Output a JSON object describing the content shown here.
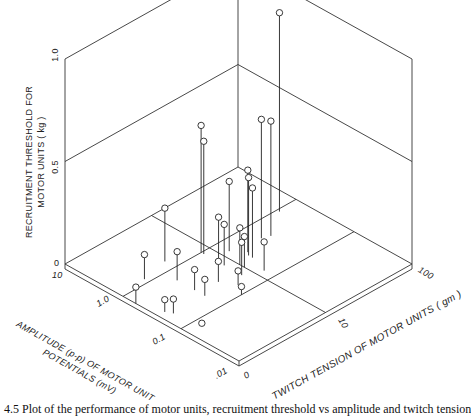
{
  "chart_data": {
    "type": "scatter",
    "subtype": "3d-stem",
    "title": "",
    "zlabel": "RECRUITMENT THRESHOLD FOR MOTOR UNITS ( kg )",
    "xlabel": "AMPLITUDE (p-p) OF MOTOR UNIT POTENTIALS (mV)",
    "ylabel": "TWITCH TENSION OF MOTOR UNITS ( gm )",
    "z_ticks": [
      "0",
      "0.5",
      "1.0"
    ],
    "zlim": [
      0,
      1.0
    ],
    "x_ticks": [
      "10",
      "1.0",
      "0.1",
      ".01"
    ],
    "x_scale": "log",
    "y_ticks": [
      "0",
      "10",
      "100"
    ],
    "y_scale": "log",
    "grid": true,
    "points": [
      {
        "amp": 0.9,
        "tension": 60,
        "threshold": 0.97
      },
      {
        "amp": 1.0,
        "tension": 8,
        "threshold": 0.62
      },
      {
        "amp": 0.9,
        "tension": 8,
        "threshold": 0.55
      },
      {
        "amp": 0.5,
        "tension": 25,
        "threshold": 0.58
      },
      {
        "amp": 0.45,
        "tension": 30,
        "threshold": 0.56
      },
      {
        "amp": 0.6,
        "tension": 12,
        "threshold": 0.34
      },
      {
        "amp": 0.4,
        "tension": 15,
        "threshold": 0.4
      },
      {
        "amp": 0.35,
        "tension": 14,
        "threshold": 0.38
      },
      {
        "amp": 0.3,
        "tension": 14,
        "threshold": 0.34
      },
      {
        "amp": 1.5,
        "tension": 4,
        "threshold": 0.26
      },
      {
        "amp": 0.5,
        "tension": 8,
        "threshold": 0.22
      },
      {
        "amp": 0.4,
        "tension": 8,
        "threshold": 0.2
      },
      {
        "amp": 0.3,
        "tension": 10,
        "threshold": 0.18
      },
      {
        "amp": 0.25,
        "tension": 10,
        "threshold": 0.15
      },
      {
        "amp": 1.2,
        "tension": 2,
        "threshold": 0.12
      },
      {
        "amp": 0.6,
        "tension": 3,
        "threshold": 0.14
      },
      {
        "amp": 0.25,
        "tension": 5,
        "threshold": 0.1
      },
      {
        "amp": 0.2,
        "tension": 8,
        "threshold": 0.16
      },
      {
        "amp": 0.15,
        "tension": 12,
        "threshold": 0.14
      },
      {
        "amp": 0.3,
        "tension": 3,
        "threshold": 0.1
      },
      {
        "amp": 0.2,
        "tension": 3,
        "threshold": 0.08
      },
      {
        "amp": 0.15,
        "tension": 6,
        "threshold": 0.07
      },
      {
        "amp": 0.25,
        "tension": 1.2,
        "threshold": 0.06
      },
      {
        "amp": 0.2,
        "tension": 1.3,
        "threshold": 0.07
      },
      {
        "amp": 0.6,
        "tension": 0.5,
        "threshold": 0.08
      },
      {
        "amp": 0.1,
        "tension": 5,
        "threshold": 0.04
      },
      {
        "amp": 0.08,
        "tension": 1.5,
        "threshold": 0.0
      }
    ]
  },
  "labels": {
    "z_axis": [
      "RECRUITMENT THRESHOLD FOR",
      "MOTOR UNITS ( kg )"
    ],
    "z_ticks": [
      "1.0",
      "0.5",
      "0"
    ],
    "x_axis": [
      "AMPLITUDE (p-p) OF MOTOR UNIT",
      "POTENTIALS (mV)"
    ],
    "x_ticks": [
      "10",
      "1.0",
      "0.1",
      ".01"
    ],
    "y_axis": "TWITCH TENSION OF MOTOR UNITS ( gm )",
    "y_ticks": [
      "0",
      "10",
      "100"
    ]
  },
  "caption": "4.5   Plot of the performance of motor units, recruitment threshold vs amplitude and twitch tension"
}
